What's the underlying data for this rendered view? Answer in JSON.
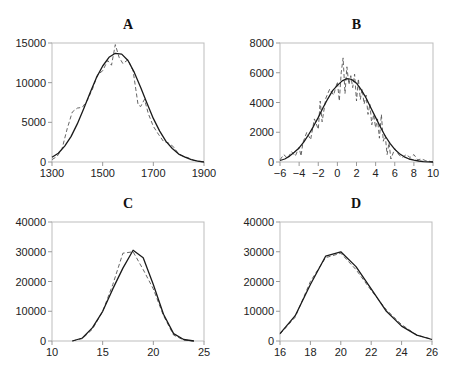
{
  "chart_data": [
    {
      "type": "line",
      "title": "A",
      "xlabel": "",
      "ylabel": "",
      "xlim": [
        1300,
        1900
      ],
      "ylim": [
        0,
        15000
      ],
      "xticks": [
        1300,
        1500,
        1700,
        1900
      ],
      "yticks": [
        0,
        5000,
        10000,
        15000
      ],
      "grid": false,
      "box": {
        "x0": 52,
        "y0": 43,
        "x1": 204,
        "y1": 162
      },
      "series": [
        {
          "name": "model",
          "style": "solid",
          "x": [
            1300,
            1325,
            1350,
            1375,
            1400,
            1425,
            1450,
            1475,
            1500,
            1525,
            1550,
            1575,
            1600,
            1625,
            1650,
            1675,
            1700,
            1725,
            1750,
            1775,
            1800,
            1825,
            1850,
            1875,
            1900
          ],
          "y": [
            600,
            1100,
            2000,
            3200,
            4800,
            6700,
            8700,
            10600,
            12100,
            13200,
            13700,
            13600,
            12800,
            11300,
            9400,
            7400,
            5500,
            3900,
            2600,
            1700,
            1000,
            600,
            300,
            100,
            0
          ]
        },
        {
          "name": "observed",
          "style": "dashed",
          "x": [
            1300,
            1320,
            1340,
            1360,
            1380,
            1400,
            1420,
            1440,
            1460,
            1480,
            1500,
            1520,
            1535,
            1550,
            1565,
            1580,
            1600,
            1620,
            1640,
            1650,
            1665,
            1680,
            1700,
            1720,
            1740,
            1760,
            1780,
            1800,
            1820,
            1840,
            1860,
            1880,
            1900
          ],
          "y": [
            300,
            700,
            1700,
            4200,
            6300,
            6800,
            6900,
            7800,
            9200,
            11000,
            11500,
            12800,
            12200,
            14800,
            13200,
            12400,
            12900,
            11500,
            7200,
            7000,
            7900,
            6100,
            4500,
            3500,
            2600,
            2400,
            1900,
            1000,
            700,
            500,
            200,
            100,
            0
          ]
        }
      ]
    },
    {
      "type": "line",
      "title": "B",
      "xlabel": "",
      "ylabel": "",
      "xlim": [
        -6,
        10
      ],
      "ylim": [
        0,
        8000
      ],
      "xticks": [
        -6,
        -4,
        -2,
        0,
        2,
        4,
        6,
        8,
        10
      ],
      "xtick_labels": [
        "−6",
        "−4",
        "−2",
        "0",
        "2",
        "4",
        "6",
        "8",
        "10"
      ],
      "yticks": [
        0,
        2000,
        4000,
        6000,
        8000
      ],
      "grid": false,
      "box": {
        "x0": 280,
        "y0": 43,
        "x1": 433,
        "y1": 162
      },
      "series": [
        {
          "name": "model",
          "style": "solid",
          "x": [
            -6,
            -5.5,
            -5,
            -4.5,
            -4,
            -3.5,
            -3,
            -2.5,
            -2,
            -1.5,
            -1,
            -0.5,
            0,
            0.5,
            1,
            1.5,
            2,
            2.5,
            3,
            3.5,
            4,
            4.5,
            5,
            5.5,
            6,
            6.5,
            7,
            7.5,
            8,
            8.5,
            9,
            9.5,
            10
          ],
          "y": [
            100,
            200,
            400,
            650,
            950,
            1350,
            1850,
            2400,
            3000,
            3650,
            4250,
            4800,
            5150,
            5450,
            5600,
            5550,
            5300,
            4850,
            4300,
            3650,
            3000,
            2350,
            1750,
            1250,
            850,
            550,
            350,
            200,
            120,
            70,
            30,
            10,
            0
          ]
        },
        {
          "name": "observed",
          "style": "dashed",
          "x": [
            -6,
            -5.6,
            -5.2,
            -4.8,
            -4.4,
            -4,
            -3.8,
            -3.6,
            -3.2,
            -2.8,
            -2.4,
            -2,
            -1.8,
            -1.6,
            -1.2,
            -0.8,
            -0.4,
            0,
            0.2,
            0.4,
            0.6,
            0.8,
            1,
            1.2,
            1.4,
            1.6,
            1.8,
            2,
            2.2,
            2.4,
            2.6,
            2.8,
            3,
            3.2,
            3.4,
            3.6,
            3.8,
            4,
            4.2,
            4.4,
            4.6,
            4.8,
            5,
            5.2,
            5.4,
            5.6,
            6,
            6.4,
            6.8,
            7.2,
            7.6,
            8,
            8.4,
            8.8,
            9.2,
            10
          ],
          "y": [
            150,
            500,
            250,
            700,
            400,
            1000,
            400,
            1300,
            2000,
            1500,
            2900,
            2200,
            4100,
            2700,
            4300,
            4900,
            4500,
            5400,
            4100,
            6000,
            7000,
            4600,
            6400,
            5200,
            5800,
            5000,
            5900,
            4100,
            5600,
            4200,
            4900,
            3900,
            4500,
            3200,
            3900,
            2500,
            3200,
            2300,
            2900,
            1600,
            3200,
            1400,
            1800,
            500,
            1300,
            200,
            900,
            500,
            300,
            500,
            300,
            500,
            150,
            200,
            100,
            0
          ]
        }
      ]
    },
    {
      "type": "line",
      "title": "C",
      "xlabel": "",
      "ylabel": "",
      "xlim": [
        10,
        25
      ],
      "ylim": [
        0,
        40000
      ],
      "xticks": [
        10,
        15,
        20,
        25
      ],
      "yticks": [
        0,
        10000,
        20000,
        30000,
        40000
      ],
      "grid": false,
      "box": {
        "x0": 52,
        "y0": 222,
        "x1": 204,
        "y1": 341
      },
      "series": [
        {
          "name": "model",
          "style": "solid",
          "x": [
            12,
            13,
            14,
            15,
            16,
            17,
            18,
            19,
            20,
            21,
            22,
            23,
            24
          ],
          "y": [
            0,
            1000,
            4500,
            10000,
            17500,
            24500,
            30500,
            28000,
            19000,
            9000,
            2500,
            500,
            0
          ]
        },
        {
          "name": "observed",
          "style": "dashed",
          "x": [
            12,
            13,
            14,
            15,
            16,
            17,
            18,
            19,
            20,
            21,
            22,
            23,
            24
          ],
          "y": [
            0,
            800,
            4000,
            10000,
            19000,
            29500,
            30000,
            24000,
            17500,
            8500,
            2000,
            300,
            0
          ]
        }
      ]
    },
    {
      "type": "line",
      "title": "D",
      "xlabel": "",
      "ylabel": "",
      "xlim": [
        16,
        26
      ],
      "ylim": [
        0,
        40000
      ],
      "xticks": [
        16,
        18,
        20,
        22,
        24,
        26
      ],
      "yticks": [
        0,
        10000,
        20000,
        30000,
        40000
      ],
      "grid": false,
      "box": {
        "x0": 280,
        "y0": 222,
        "x1": 432,
        "y1": 341
      },
      "series": [
        {
          "name": "model",
          "style": "solid",
          "x": [
            16,
            17,
            18,
            19,
            20,
            21,
            22,
            23,
            24,
            25,
            26
          ],
          "y": [
            2500,
            8500,
            19000,
            28500,
            30000,
            25000,
            17500,
            10000,
            5000,
            2000,
            500
          ]
        },
        {
          "name": "observed",
          "style": "dashed",
          "x": [
            16,
            17,
            18,
            19,
            20,
            21,
            22,
            23,
            24,
            25,
            26
          ],
          "y": [
            2300,
            8000,
            20000,
            28000,
            29500,
            24000,
            17000,
            10500,
            5500,
            2000,
            600
          ]
        }
      ]
    }
  ]
}
